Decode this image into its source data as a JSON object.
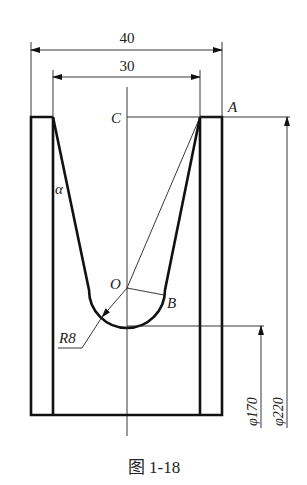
{
  "figure": {
    "caption": "图 1-18",
    "dimensions": {
      "outer_width": "40",
      "inner_width": "30",
      "dia_small": "φ170",
      "dia_large": "φ220",
      "radius": "R8"
    },
    "points": {
      "A": "A",
      "C": "C",
      "O": "O",
      "B": "B",
      "alpha": "α"
    }
  }
}
